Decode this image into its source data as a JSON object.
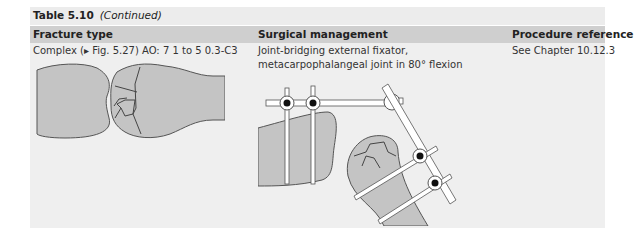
{
  "table": {
    "title": "Table 5.10",
    "title_suffix": "(Continued)",
    "headers": [
      "Fracture type",
      "Surgical management",
      "Procedure reference"
    ],
    "rows": [
      {
        "fracture_type": "Complex (▸ Fig. 5.27) AO: 7 1 to 5 0.3-C3",
        "surgical_management_line1": "Joint-bridging external fixator,",
        "surgical_management_line2": "metacarpophalangeal joint in 80° flexion",
        "procedure_reference": "See Chapter 10.12.3",
        "fracture_illustration": "complex-intra-articular-fracture-illustration",
        "management_illustration": "joint-bridging-external-fixator-illustration"
      }
    ]
  },
  "colors": {
    "background": "#efefef",
    "header_background": "#cfcfcf",
    "bone_fill": "#c4c4c4",
    "outline": "#4a4a4a"
  }
}
